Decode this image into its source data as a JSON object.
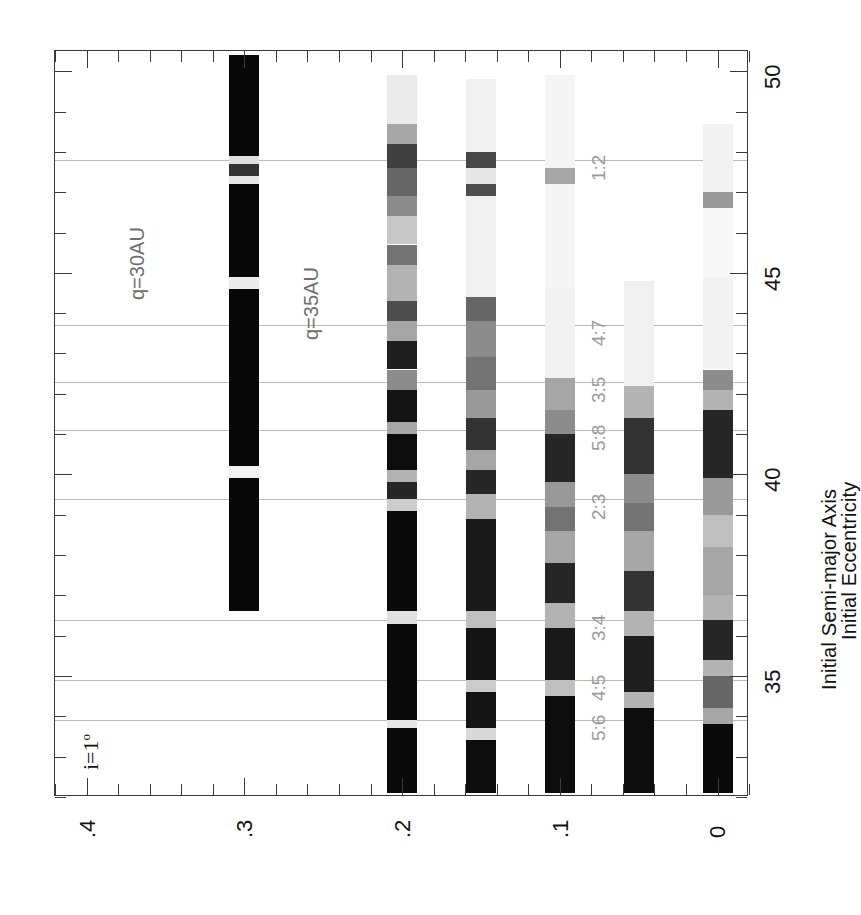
{
  "figure": {
    "annotation_inclination": "i=1",
    "annotation_inclination_unit": "o",
    "q_curves": [
      {
        "label": "q=30AU",
        "q": 30
      },
      {
        "label": "q=35AU",
        "q": 35
      }
    ]
  },
  "axes": {
    "x": {
      "label": "Initial Eccentricity",
      "ticklabels": [
        ".4",
        ".3",
        ".2",
        ".1",
        "0"
      ],
      "tickvalues": [
        0.4,
        0.3,
        0.2,
        0.1,
        0.0
      ],
      "range": [
        0.42,
        -0.02
      ],
      "minor_step": 0.02
    },
    "y": {
      "label": "Initial Semi-major Axis",
      "ticklabels": [
        "50",
        "45",
        "40",
        "35"
      ],
      "tickvalues": [
        50,
        45,
        40,
        35
      ],
      "range": [
        50.5,
        32.0
      ],
      "minor_step": 1
    }
  },
  "resonances": [
    {
      "label": "1:2",
      "a": 47.8
    },
    {
      "label": "4:7",
      "a": 43.7
    },
    {
      "label": "3:5",
      "a": 42.3
    },
    {
      "label": "5:8",
      "a": 41.1
    },
    {
      "label": "2:3",
      "a": 39.4
    },
    {
      "label": "3:4",
      "a": 36.4
    },
    {
      "label": "4:5",
      "a": 34.9
    },
    {
      "label": "5:6",
      "a": 33.9
    }
  ],
  "chart_data": {
    "type": "heatmap",
    "title": "",
    "xlabel": "Initial Eccentricity",
    "ylabel": "Initial Semi-major Axis",
    "xlim": [
      0.42,
      -0.02
    ],
    "ylim": [
      50.5,
      32.0
    ],
    "grid": true,
    "legend": "none",
    "colorscale": {
      "min": "#ffffff",
      "max": "#000000",
      "meaning": "fraction surviving / dynamical lifetime (dark = stable)"
    },
    "rows": [
      {
        "e": 0.3,
        "a_min": 36.6,
        "a_max": 50.4,
        "segments": [
          {
            "a0": 36.6,
            "a1": 39.9,
            "v": 0.97
          },
          {
            "a0": 39.9,
            "a1": 40.2,
            "v": 0.05
          },
          {
            "a0": 40.2,
            "a1": 44.6,
            "v": 0.97
          },
          {
            "a0": 44.6,
            "a1": 44.9,
            "v": 0.08
          },
          {
            "a0": 44.9,
            "a1": 47.2,
            "v": 0.97
          },
          {
            "a0": 47.2,
            "a1": 47.4,
            "v": 0.1
          },
          {
            "a0": 47.4,
            "a1": 47.7,
            "v": 0.8
          },
          {
            "a0": 47.7,
            "a1": 47.9,
            "v": 0.12
          },
          {
            "a0": 47.9,
            "a1": 50.4,
            "v": 0.97
          }
        ]
      },
      {
        "e": 0.2,
        "a_min": 32.1,
        "a_max": 49.9,
        "segments": [
          {
            "a0": 32.1,
            "a1": 33.7,
            "v": 0.96
          },
          {
            "a0": 33.7,
            "a1": 33.9,
            "v": 0.1
          },
          {
            "a0": 33.9,
            "a1": 36.3,
            "v": 0.96
          },
          {
            "a0": 36.3,
            "a1": 36.6,
            "v": 0.12
          },
          {
            "a0": 36.6,
            "a1": 39.1,
            "v": 0.96
          },
          {
            "a0": 39.1,
            "a1": 39.4,
            "v": 0.2
          },
          {
            "a0": 39.4,
            "a1": 39.8,
            "v": 0.85
          },
          {
            "a0": 39.8,
            "a1": 40.1,
            "v": 0.3
          },
          {
            "a0": 40.1,
            "a1": 41.0,
            "v": 0.95
          },
          {
            "a0": 41.0,
            "a1": 41.3,
            "v": 0.35
          },
          {
            "a0": 41.3,
            "a1": 42.1,
            "v": 0.92
          },
          {
            "a0": 42.1,
            "a1": 42.6,
            "v": 0.45
          },
          {
            "a0": 42.6,
            "a1": 43.3,
            "v": 0.88
          },
          {
            "a0": 43.3,
            "a1": 43.8,
            "v": 0.35
          },
          {
            "a0": 43.8,
            "a1": 44.3,
            "v": 0.7
          },
          {
            "a0": 44.3,
            "a1": 45.2,
            "v": 0.3
          },
          {
            "a0": 45.2,
            "a1": 45.7,
            "v": 0.55
          },
          {
            "a0": 45.7,
            "a1": 46.4,
            "v": 0.22
          },
          {
            "a0": 46.4,
            "a1": 46.9,
            "v": 0.45
          },
          {
            "a0": 46.9,
            "a1": 47.6,
            "v": 0.6
          },
          {
            "a0": 47.6,
            "a1": 48.2,
            "v": 0.75
          },
          {
            "a0": 48.2,
            "a1": 48.7,
            "v": 0.35
          },
          {
            "a0": 48.7,
            "a1": 49.9,
            "v": 0.08
          }
        ]
      },
      {
        "e": 0.15,
        "a_min": 32.1,
        "a_max": 49.8,
        "segments": [
          {
            "a0": 32.1,
            "a1": 33.4,
            "v": 0.95
          },
          {
            "a0": 33.4,
            "a1": 33.7,
            "v": 0.15
          },
          {
            "a0": 33.7,
            "a1": 34.6,
            "v": 0.92
          },
          {
            "a0": 34.6,
            "a1": 34.9,
            "v": 0.2
          },
          {
            "a0": 34.9,
            "a1": 36.2,
            "v": 0.92
          },
          {
            "a0": 36.2,
            "a1": 36.6,
            "v": 0.25
          },
          {
            "a0": 36.6,
            "a1": 38.9,
            "v": 0.9
          },
          {
            "a0": 38.9,
            "a1": 39.5,
            "v": 0.3
          },
          {
            "a0": 39.5,
            "a1": 40.1,
            "v": 0.85
          },
          {
            "a0": 40.1,
            "a1": 40.6,
            "v": 0.35
          },
          {
            "a0": 40.6,
            "a1": 41.4,
            "v": 0.8
          },
          {
            "a0": 41.4,
            "a1": 42.1,
            "v": 0.4
          },
          {
            "a0": 42.1,
            "a1": 42.9,
            "v": 0.55
          },
          {
            "a0": 42.9,
            "a1": 43.8,
            "v": 0.45
          },
          {
            "a0": 43.8,
            "a1": 44.4,
            "v": 0.6
          },
          {
            "a0": 44.4,
            "a1": 46.9,
            "v": 0.06
          },
          {
            "a0": 46.9,
            "a1": 47.2,
            "v": 0.7
          },
          {
            "a0": 47.2,
            "a1": 47.6,
            "v": 0.1
          },
          {
            "a0": 47.6,
            "a1": 48.0,
            "v": 0.72
          },
          {
            "a0": 48.0,
            "a1": 49.8,
            "v": 0.06
          }
        ]
      },
      {
        "e": 0.1,
        "a_min": 32.1,
        "a_max": 49.9,
        "segments": [
          {
            "a0": 32.1,
            "a1": 34.5,
            "v": 0.95
          },
          {
            "a0": 34.5,
            "a1": 34.9,
            "v": 0.25
          },
          {
            "a0": 34.9,
            "a1": 36.2,
            "v": 0.9
          },
          {
            "a0": 36.2,
            "a1": 36.8,
            "v": 0.3
          },
          {
            "a0": 36.8,
            "a1": 37.8,
            "v": 0.85
          },
          {
            "a0": 37.8,
            "a1": 38.6,
            "v": 0.35
          },
          {
            "a0": 38.6,
            "a1": 39.2,
            "v": 0.55
          },
          {
            "a0": 39.2,
            "a1": 39.8,
            "v": 0.4
          },
          {
            "a0": 39.8,
            "a1": 41.0,
            "v": 0.85
          },
          {
            "a0": 41.0,
            "a1": 41.6,
            "v": 0.45
          },
          {
            "a0": 41.6,
            "a1": 42.4,
            "v": 0.35
          },
          {
            "a0": 42.4,
            "a1": 44.6,
            "v": 0.05
          },
          {
            "a0": 44.6,
            "a1": 47.2,
            "v": 0.04
          },
          {
            "a0": 47.2,
            "a1": 47.6,
            "v": 0.35
          },
          {
            "a0": 47.6,
            "a1": 49.9,
            "v": 0.04
          }
        ]
      },
      {
        "e": 0.05,
        "a_min": 32.1,
        "a_max": 44.8,
        "segments": [
          {
            "a0": 32.1,
            "a1": 34.2,
            "v": 0.95
          },
          {
            "a0": 34.2,
            "a1": 34.6,
            "v": 0.3
          },
          {
            "a0": 34.6,
            "a1": 36.0,
            "v": 0.88
          },
          {
            "a0": 36.0,
            "a1": 36.6,
            "v": 0.3
          },
          {
            "a0": 36.6,
            "a1": 37.6,
            "v": 0.8
          },
          {
            "a0": 37.6,
            "a1": 38.6,
            "v": 0.35
          },
          {
            "a0": 38.6,
            "a1": 39.3,
            "v": 0.55
          },
          {
            "a0": 39.3,
            "a1": 40.0,
            "v": 0.45
          },
          {
            "a0": 40.0,
            "a1": 41.4,
            "v": 0.8
          },
          {
            "a0": 41.4,
            "a1": 42.2,
            "v": 0.3
          },
          {
            "a0": 42.2,
            "a1": 44.8,
            "v": 0.06
          }
        ]
      },
      {
        "e": 0.0,
        "a_min": 32.1,
        "a_max": 48.7,
        "segments": [
          {
            "a0": 32.1,
            "a1": 33.8,
            "v": 0.96
          },
          {
            "a0": 33.8,
            "a1": 34.2,
            "v": 0.35
          },
          {
            "a0": 34.2,
            "a1": 35.0,
            "v": 0.6
          },
          {
            "a0": 35.0,
            "a1": 35.4,
            "v": 0.3
          },
          {
            "a0": 35.4,
            "a1": 36.4,
            "v": 0.85
          },
          {
            "a0": 36.4,
            "a1": 37.0,
            "v": 0.3
          },
          {
            "a0": 37.0,
            "a1": 38.2,
            "v": 0.35
          },
          {
            "a0": 38.2,
            "a1": 39.0,
            "v": 0.25
          },
          {
            "a0": 39.0,
            "a1": 39.9,
            "v": 0.4
          },
          {
            "a0": 39.9,
            "a1": 41.6,
            "v": 0.85
          },
          {
            "a0": 41.6,
            "a1": 42.1,
            "v": 0.3
          },
          {
            "a0": 42.1,
            "a1": 42.6,
            "v": 0.45
          },
          {
            "a0": 42.6,
            "a1": 44.9,
            "v": 0.05
          },
          {
            "a0": 44.9,
            "a1": 46.6,
            "v": 0.03
          },
          {
            "a0": 46.6,
            "a1": 47.0,
            "v": 0.4
          },
          {
            "a0": 47.0,
            "a1": 48.7,
            "v": 0.05
          }
        ]
      }
    ]
  }
}
